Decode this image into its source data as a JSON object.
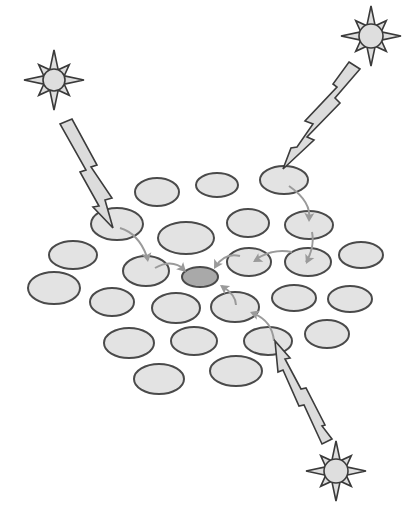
{
  "diagram": {
    "colors": {
      "background": "#ffffff",
      "ellipse_fill": "#e3e3e3",
      "ellipse_stroke": "#4a4a4a",
      "center_fill": "#a9a9a9",
      "bolt_fill": "#dcdcdc",
      "bolt_stroke": "#3c3c3c",
      "star_fill": "#dedede",
      "star_stroke": "#3a3a3a",
      "arrow_color": "#9a9a9a"
    },
    "stars": [
      {
        "name": "star-top-left",
        "cx": 54,
        "cy": 80,
        "r_outer": 30,
        "r_inner": 11,
        "core": 11
      },
      {
        "name": "star-top-right",
        "cx": 371,
        "cy": 36,
        "r_outer": 30,
        "r_inner": 11,
        "core": 12
      },
      {
        "name": "star-bottom-right",
        "cx": 336,
        "cy": 471,
        "r_outer": 30,
        "r_inner": 11,
        "core": 12
      }
    ],
    "bolts": [
      {
        "name": "bolt-top-left",
        "points": "60,124 72,119 97,165 91,167 112,198 105,200 113,228 93,207 99,206 80,172 86,170"
      },
      {
        "name": "bolt-top-right",
        "points": "349,62 360,69 335,98 340,103 307,137 314,140 283,169 291,148 297,147 313,124 305,121 337,87 333,84"
      },
      {
        "name": "bolt-bottom-right",
        "points": "332,439 322,444 304,405 299,406 283,370 278,372 275,341 290,358 285,359 301,389 306,388 325,425 322,426"
      }
    ],
    "ellipses": [
      {
        "cx": 157,
        "cy": 192,
        "rx": 22,
        "ry": 14
      },
      {
        "cx": 217,
        "cy": 185,
        "rx": 21,
        "ry": 12
      },
      {
        "cx": 284,
        "cy": 180,
        "rx": 24,
        "ry": 14
      },
      {
        "cx": 117,
        "cy": 224,
        "rx": 26,
        "ry": 16
      },
      {
        "cx": 186,
        "cy": 238,
        "rx": 28,
        "ry": 16
      },
      {
        "cx": 248,
        "cy": 223,
        "rx": 21,
        "ry": 14
      },
      {
        "cx": 309,
        "cy": 225,
        "rx": 24,
        "ry": 14
      },
      {
        "cx": 73,
        "cy": 255,
        "rx": 24,
        "ry": 14
      },
      {
        "cx": 146,
        "cy": 271,
        "rx": 23,
        "ry": 15
      },
      {
        "cx": 249,
        "cy": 262,
        "rx": 22,
        "ry": 14
      },
      {
        "cx": 308,
        "cy": 262,
        "rx": 23,
        "ry": 14
      },
      {
        "cx": 361,
        "cy": 255,
        "rx": 22,
        "ry": 13
      },
      {
        "cx": 54,
        "cy": 288,
        "rx": 26,
        "ry": 16
      },
      {
        "cx": 112,
        "cy": 302,
        "rx": 22,
        "ry": 14
      },
      {
        "cx": 176,
        "cy": 308,
        "rx": 24,
        "ry": 15
      },
      {
        "cx": 235,
        "cy": 307,
        "rx": 24,
        "ry": 15
      },
      {
        "cx": 294,
        "cy": 298,
        "rx": 22,
        "ry": 13
      },
      {
        "cx": 350,
        "cy": 299,
        "rx": 22,
        "ry": 13
      },
      {
        "cx": 129,
        "cy": 343,
        "rx": 25,
        "ry": 15
      },
      {
        "cx": 194,
        "cy": 341,
        "rx": 23,
        "ry": 14
      },
      {
        "cx": 268,
        "cy": 341,
        "rx": 24,
        "ry": 14
      },
      {
        "cx": 327,
        "cy": 334,
        "rx": 22,
        "ry": 14
      },
      {
        "cx": 159,
        "cy": 379,
        "rx": 25,
        "ry": 15
      },
      {
        "cx": 236,
        "cy": 371,
        "rx": 26,
        "ry": 15
      }
    ],
    "center_ellipse": {
      "cx": 200,
      "cy": 277,
      "rx": 18,
      "ry": 10
    },
    "arrows": [
      {
        "name": "arrow-left-1",
        "d": "M120,228 Q140,234 148,260",
        "tip": [
          148,
          262
        ],
        "angle": 80
      },
      {
        "name": "arrow-left-2",
        "d": "M155,268 Q172,258 185,270",
        "tip": [
          186,
          272
        ],
        "angle": 45
      },
      {
        "name": "arrow-tr-1",
        "d": "M289,186 Q312,202 309,220",
        "tip": [
          309,
          222
        ],
        "angle": 92
      },
      {
        "name": "arrow-tr-2",
        "d": "M312,232 Q315,248 306,262",
        "tip": [
          306,
          264
        ],
        "angle": 115
      },
      {
        "name": "arrow-tr-3",
        "d": "M292,252 Q272,248 255,260",
        "tip": [
          253,
          262
        ],
        "angle": 150
      },
      {
        "name": "arrow-tr-4",
        "d": "M240,256 Q225,252 215,267",
        "tip": [
          214,
          269
        ],
        "angle": 120
      },
      {
        "name": "arrow-br-1",
        "d": "M274,341 Q272,320 252,313",
        "tip": [
          250,
          312
        ],
        "angle": 200
      },
      {
        "name": "arrow-br-2",
        "d": "M236,305 Q236,295 222,286",
        "tip": [
          220,
          285
        ],
        "angle": 215
      }
    ]
  }
}
